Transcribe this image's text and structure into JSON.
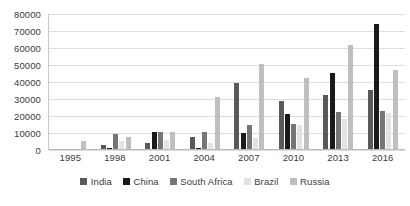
{
  "chart_data": {
    "type": "bar",
    "title": "",
    "subtitle": "",
    "xlabel": "",
    "ylabel": "",
    "ylim": [
      0,
      80000
    ],
    "ytick_step": 10000,
    "yticks": [
      "80000",
      "70000",
      "60000",
      "50000",
      "40000",
      "30000",
      "20000",
      "10000",
      "0"
    ],
    "grid": true,
    "grid_axis": "y",
    "legend_position": "bottom",
    "categories": [
      "1995",
      "1998",
      "2001",
      "2004",
      "2007",
      "2010",
      "2013",
      "2016"
    ],
    "series": [
      {
        "name": "India",
        "color": "#595959",
        "values": [
          0,
          2500,
          3500,
          7200,
          39000,
          28000,
          32000,
          35000
        ]
      },
      {
        "name": "China",
        "color": "#1a1a1a",
        "values": [
          0,
          700,
          10200,
          500,
          9700,
          20600,
          45000,
          73500
        ]
      },
      {
        "name": "South Africa",
        "color": "#757575",
        "values": [
          0,
          8800,
          10200,
          10100,
          14300,
          15000,
          21500,
          22200
        ]
      },
      {
        "name": "Brazil",
        "color": "#e3e3e3",
        "values": [
          0,
          5000,
          5100,
          3800,
          6400,
          14300,
          17800,
          21000
        ]
      },
      {
        "name": "Russia",
        "color": "#bfbfbf",
        "values": [
          5000,
          6800,
          10200,
          30600,
          50200,
          41800,
          61000,
          46200
        ]
      }
    ]
  },
  "legend": {
    "items": [
      {
        "label": "India"
      },
      {
        "label": "China"
      },
      {
        "label": "South Africa"
      },
      {
        "label": "Brazil"
      },
      {
        "label": "Russia"
      }
    ]
  }
}
